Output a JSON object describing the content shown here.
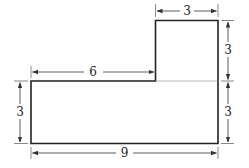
{
  "diagram": {
    "type": "L-shaped figure with dimensions",
    "colors": {
      "stroke": "#222222",
      "dim": "#333333",
      "background": "#ffffff"
    },
    "labels": {
      "tower_width": "3",
      "tower_height": "3",
      "base_right_height": "3",
      "base_left_height": "3",
      "base_top_left_length": "6",
      "base_width": "9"
    }
  }
}
